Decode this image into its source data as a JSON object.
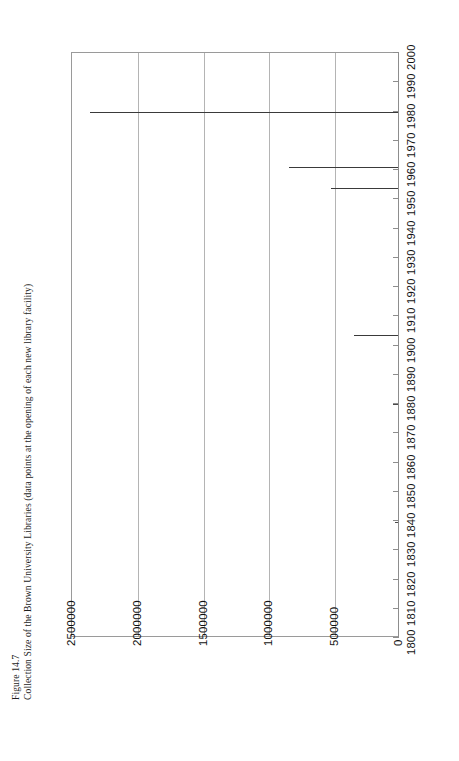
{
  "figure": {
    "number_label": "Figure 14.7",
    "caption": "Collection Size of the Brown University Libraries (data points at the opening of each new library facility)"
  },
  "chart_data": {
    "type": "bar",
    "orientation": "horizontal-rotated",
    "title": "Collection Size of the Brown University Libraries (data points at the opening of each new library facility)",
    "xlabel": "",
    "ylabel": "",
    "grid": true,
    "legend": null,
    "value_axis": {
      "name": "collection size",
      "ticks": [
        "2500000",
        "2000000",
        "1500000",
        "1000000",
        "500000",
        "0"
      ],
      "tick_values": [
        2500000,
        2000000,
        1500000,
        1000000,
        500000,
        0
      ],
      "min": 0,
      "max": 2500000,
      "direction": "decreasing-left-to-right"
    },
    "category_axis": {
      "name": "year",
      "categories": [
        "2000",
        "1990",
        "1980",
        "1970",
        "1960",
        "1950",
        "1940",
        "1930",
        "1920",
        "1910",
        "1900",
        "1890",
        "1880",
        "1870",
        "1860",
        "1850",
        "1840",
        "1830",
        "1820",
        "1810",
        "1800"
      ],
      "min": 1800,
      "max": 2000,
      "step": 10,
      "direction": "decreasing-top-to-bottom"
    },
    "points": [
      {
        "year": 1990,
        "value": 2300000
      },
      {
        "year": 1970,
        "value": 840000
      },
      {
        "year": 1962,
        "value": 520000
      },
      {
        "year": 1910,
        "value": 345000
      },
      {
        "year": 1870,
        "value": 45000
      },
      {
        "year": 1840,
        "value": 30000
      }
    ],
    "series": [
      {
        "name": "Collection size at opening of new library facility",
        "categories": [
          "1840",
          "1870",
          "1910",
          "1962",
          "1970",
          "1990"
        ],
        "values": [
          30000,
          45000,
          345000,
          520000,
          840000,
          2300000
        ]
      }
    ]
  },
  "colors": {
    "bar": "#3a3a3a",
    "grid": "#b4b4b4",
    "axis": "#8d8d8d",
    "text": "#111111",
    "background": "#ffffff"
  }
}
